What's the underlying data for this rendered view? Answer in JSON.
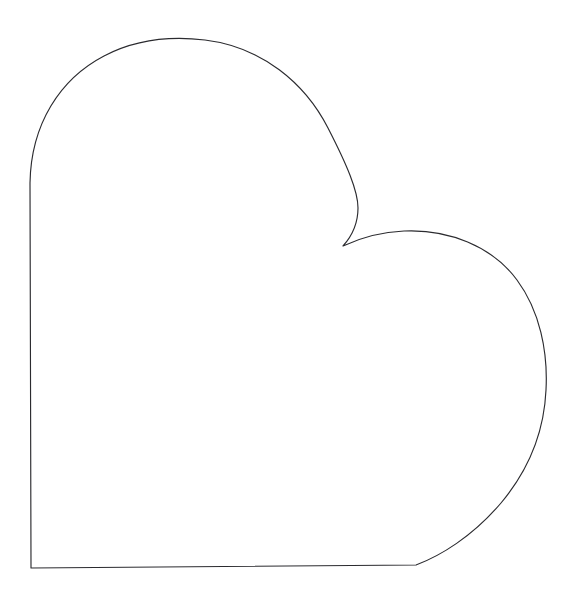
{
  "canvas": {
    "width": 580,
    "height": 599,
    "background_color": "#ffffff",
    "description": "Line drawing of a rounded heart / cloud-like outline on a plain white background"
  },
  "drawing": {
    "name": "heart-outline",
    "title": "",
    "fill_color": "#ffffff",
    "stroke_color": "#2b2b2f",
    "stroke_width": 1.15,
    "anchor_points": {
      "left_lobe_apex": [
        195,
        38
      ],
      "left_edge_top": [
        30,
        183
      ],
      "bottom_left_corner": [
        31,
        568
      ],
      "bottom_right_corner": [
        416,
        565
      ],
      "left_lobe_right_extent": [
        358,
        208
      ],
      "cleft_vertex": [
        343,
        246
      ],
      "right_lobe_apex": [
        415,
        231
      ],
      "right_extreme": [
        546,
        390
      ]
    },
    "path_d": "M 30 183 C 31 124 60 79 104 56 C 142 36 180 37 205 40 C 262 47 305 83 328 128 C 347 165 358 191 358 208 C 358 224 352 236 343 246 C 360 238 381 232 404 231 C 448 229 492 246 517 280 C 540 311 548 352 546 390 C 544 434 527 472 501 503 C 472 537 440 556 416 565 L 31 568 Z"
  }
}
